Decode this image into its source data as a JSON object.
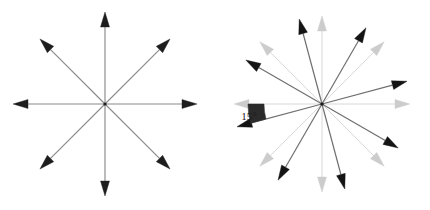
{
  "figure": {
    "background_color": "#ffffff",
    "width": 430,
    "height": 210,
    "panels": [
      {
        "id": "original-star",
        "name": "left-panel",
        "caption": "",
        "center": {
          "x": 105,
          "y": 104
        },
        "radius": 92,
        "arrow_count": 8,
        "arrow_angles_deg": [
          0,
          45,
          90,
          135,
          180,
          225,
          270,
          315
        ],
        "line_color": "#8a8a8a",
        "head_color": "#1d1d1d",
        "line_width": 1.15,
        "head_length": 15,
        "head_width": 9
      },
      {
        "id": "rotated-star",
        "name": "right-panel",
        "caption": "",
        "center": {
          "x": 322,
          "y": 104
        },
        "radius": 88,
        "arrow_count": 8,
        "arrow_angles_deg": [
          0,
          45,
          90,
          135,
          180,
          225,
          270,
          315
        ],
        "rotation_deg": 15,
        "rotation_direction": "counterclockwise",
        "ghost_line_color": "#d8d8d8",
        "ghost_head_color": "#cccccc",
        "ghost_line_width": 1.0,
        "line_color": "#6f6f6f",
        "head_color": "#141414",
        "line_width": 1.2,
        "head_length": 15,
        "head_width": 9,
        "annotation": {
          "label": "15°",
          "label_x": 249,
          "label_y": 120,
          "wedge_color": "#2b2b2b",
          "wedge_inner_radius": 58,
          "wedge_outer_radius": 74,
          "wedge_start_deg": 180,
          "wedge_end_deg": 195
        }
      }
    ]
  }
}
